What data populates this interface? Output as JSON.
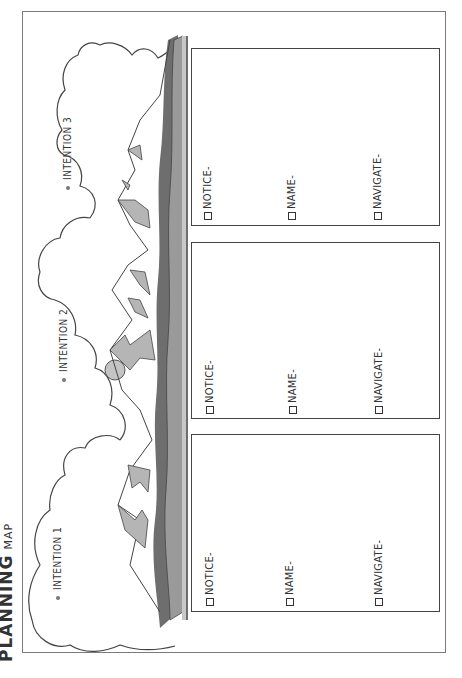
{
  "worksheet": {
    "title_main": "PLANNING",
    "title_sub": "MAP",
    "colors": {
      "outline": "#444444",
      "mountain_fill": "#b5b5b5",
      "ground_dark": "#6e6e6e",
      "ground_mid": "#9a9a9a",
      "ground_light": "#c8c8c8",
      "sun": "#c4c4c4"
    },
    "intentions": [
      {
        "label": "INTENTION 1",
        "icon": "dot-icon"
      },
      {
        "label": "INTENTION 2",
        "icon": "dot-icon"
      },
      {
        "label": "INTENTION 3",
        "icon": "dot-icon"
      }
    ],
    "panels": [
      {
        "items": [
          {
            "label": "NOTICE-",
            "checked": false
          },
          {
            "label": "NAME-",
            "checked": false
          },
          {
            "label": "NAVIGATE-",
            "checked": false
          }
        ]
      },
      {
        "items": [
          {
            "label": "NOTICE-",
            "checked": false
          },
          {
            "label": "NAME-",
            "checked": false
          },
          {
            "label": "NAVIGATE-",
            "checked": false
          }
        ]
      },
      {
        "items": [
          {
            "label": "NOTICE-",
            "checked": false
          },
          {
            "label": "NAME-",
            "checked": false
          },
          {
            "label": "NAVIGATE-",
            "checked": false
          }
        ]
      }
    ]
  }
}
